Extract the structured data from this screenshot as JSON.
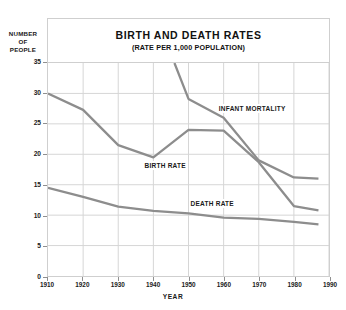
{
  "chart_data": {
    "type": "line",
    "title": "BIRTH AND DEATH RATES",
    "subtitle": "(RATE PER 1,000 POPULATION)",
    "xlabel": "YEAR",
    "ylabel": "NUMBER OF PEOPLE",
    "ylabel_lines": [
      "NUMBER",
      "OF",
      "PEOPLE"
    ],
    "xlim": [
      1910,
      1990
    ],
    "ylim": [
      0,
      35
    ],
    "xticks": [
      1910,
      1920,
      1930,
      1940,
      1950,
      1960,
      1970,
      1980,
      1990
    ],
    "yticks": [
      0,
      5,
      10,
      15,
      20,
      25,
      30,
      35
    ],
    "grid": true,
    "legend_position": "inline-annotations",
    "line_color": "#8d8d8d",
    "grid_color": "#d6d6d6",
    "text_color": "#1a1a1a",
    "series": [
      {
        "name": "BIRTH RATE",
        "label_x": 1937,
        "label_y": 18.2,
        "x": [
          1910,
          1920,
          1930,
          1940,
          1950,
          1960,
          1970,
          1980,
          1987
        ],
        "values": [
          30.0,
          27.3,
          21.5,
          19.5,
          24.0,
          23.9,
          18.7,
          11.5,
          10.8
        ]
      },
      {
        "name": "INFANT MORTALITY",
        "label_x": 1958,
        "label_y": 27.5,
        "x": [
          1946,
          1950,
          1960,
          1970,
          1980,
          1987
        ],
        "values": [
          35.0,
          29.1,
          26.0,
          19.0,
          16.2,
          16.0
        ]
      },
      {
        "name": "DEATH RATE",
        "label_x": 1950,
        "label_y": 12.0,
        "x": [
          1910,
          1920,
          1930,
          1940,
          1950,
          1960,
          1970,
          1980,
          1987
        ],
        "values": [
          14.5,
          13.0,
          11.4,
          10.7,
          10.3,
          9.6,
          9.4,
          8.9,
          8.5
        ]
      }
    ]
  }
}
